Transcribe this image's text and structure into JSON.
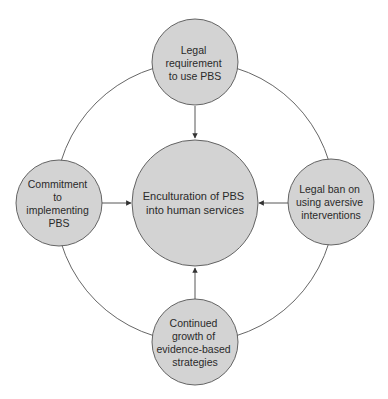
{
  "diagram": {
    "type": "hub-and-ring",
    "colors": {
      "node_fill": "#d3d3d3",
      "stroke": "#555555",
      "text": "#2a2a2a",
      "background": "#ffffff"
    },
    "center": {
      "id": "enculturation",
      "lines": [
        "Enculturation of PBS",
        "into human services"
      ]
    },
    "nodes": [
      {
        "id": "legal-requirement",
        "position": "top",
        "lines": [
          "Legal",
          "requirement",
          "to use PBS"
        ]
      },
      {
        "id": "commitment",
        "position": "left",
        "lines": [
          "Commitment",
          "to",
          "implementing",
          "PBS"
        ]
      },
      {
        "id": "legal-ban",
        "position": "right",
        "lines": [
          "Legal ban on",
          "using aversive",
          "interventions"
        ]
      },
      {
        "id": "continued-growth",
        "position": "bottom",
        "lines": [
          "Continued",
          "growth of",
          "evidence-based",
          "strategies"
        ]
      }
    ],
    "edges": [
      {
        "from": "legal-requirement",
        "to": "enculturation"
      },
      {
        "from": "commitment",
        "to": "enculturation"
      },
      {
        "from": "legal-ban",
        "to": "enculturation"
      },
      {
        "from": "continued-growth",
        "to": "enculturation"
      }
    ]
  }
}
